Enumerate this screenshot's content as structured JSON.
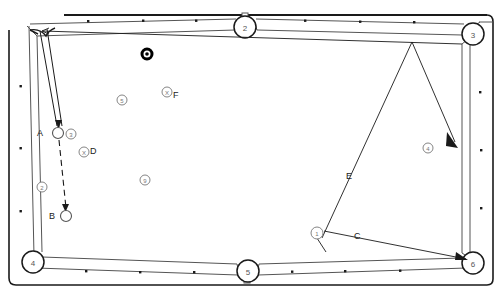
{
  "diagram": {
    "type": "pool-table-shot-diagram",
    "title": "",
    "colors": {
      "line": "#1a1a1a",
      "rail": "#555555",
      "ball_outline": "#555555",
      "eight_ball": "#000000",
      "label": "#1a1a1a",
      "background": "#ffffff"
    },
    "table": {
      "outer": {
        "x": 8,
        "y": 8,
        "w": 485,
        "h": 278
      },
      "bed": {
        "x": 22,
        "y": 22,
        "w": 457,
        "h": 250
      }
    },
    "pockets": [
      {
        "id": "p2",
        "label": "2",
        "cx": 245,
        "cy": 27,
        "r": 11,
        "position": "top-middle"
      },
      {
        "id": "p3",
        "label": "3",
        "cx": 473,
        "cy": 34,
        "r": 11,
        "position": "top-right"
      },
      {
        "id": "p4",
        "label": "4",
        "cx": 33,
        "cy": 262,
        "r": 11,
        "position": "bottom-left"
      },
      {
        "id": "p5",
        "label": "5",
        "cx": 248,
        "cy": 271,
        "r": 11,
        "position": "bottom-middle"
      },
      {
        "id": "p6",
        "label": "6",
        "cx": 473,
        "cy": 263,
        "r": 11,
        "position": "bottom-right"
      }
    ],
    "diamonds": {
      "top": [
        {
          "x": 88,
          "y": 21
        },
        {
          "x": 143,
          "y": 20
        },
        {
          "x": 196,
          "y": 20
        },
        {
          "x": 305,
          "y": 20
        },
        {
          "x": 360,
          "y": 21
        },
        {
          "x": 414,
          "y": 22
        }
      ],
      "bottom": [
        {
          "x": 86,
          "y": 271
        },
        {
          "x": 140,
          "y": 272
        },
        {
          "x": 194,
          "y": 272
        },
        {
          "x": 292,
          "y": 271
        },
        {
          "x": 345,
          "y": 271
        },
        {
          "x": 400,
          "y": 270
        }
      ],
      "left": [
        {
          "x": 20,
          "y": 86
        },
        {
          "x": 20,
          "y": 148
        },
        {
          "x": 20,
          "y": 211
        }
      ],
      "right": [
        {
          "x": 480,
          "y": 92
        },
        {
          "x": 481,
          "y": 150
        },
        {
          "x": 481,
          "y": 208
        }
      ]
    },
    "balls": [
      {
        "id": "ball-a",
        "label": "A",
        "cx": 58,
        "cy": 133,
        "r": 5.5,
        "marker": "",
        "label_pos": "left",
        "style": "open"
      },
      {
        "id": "ball-b",
        "label": "B",
        "cx": 66,
        "cy": 216,
        "r": 5.5,
        "marker": "",
        "label_pos": "left",
        "style": "open"
      },
      {
        "id": "ball-eight",
        "label": "",
        "cx": 147,
        "cy": 54,
        "r": 4.5,
        "marker": "8",
        "label_pos": "",
        "style": "eight"
      },
      {
        "id": "ball-3",
        "label": "",
        "cx": 71,
        "cy": 134,
        "r": 5,
        "marker": "3",
        "label_pos": "",
        "style": "numbered"
      },
      {
        "id": "ball-5",
        "label": "",
        "cx": 122,
        "cy": 100,
        "r": 5,
        "marker": "5",
        "label_pos": "",
        "style": "numbered"
      },
      {
        "id": "ball-9",
        "label": "",
        "cx": 145,
        "cy": 180,
        "r": 5,
        "marker": "9",
        "label_pos": "",
        "style": "numbered"
      },
      {
        "id": "ball-4",
        "label": "",
        "cx": 428,
        "cy": 148,
        "r": 5,
        "marker": "4",
        "label_pos": "",
        "style": "numbered"
      },
      {
        "id": "ball-2",
        "label": "",
        "cx": 42,
        "cy": 187,
        "r": 5,
        "marker": "2",
        "label_pos": "",
        "style": "numbered"
      },
      {
        "id": "ball-x-d",
        "label": "D",
        "cx": 84,
        "cy": 152,
        "r": 5,
        "marker": "X",
        "label_pos": "right",
        "style": "ghost"
      },
      {
        "id": "ball-x-f",
        "label": "F",
        "cx": 167,
        "cy": 92,
        "r": 5,
        "marker": "X",
        "label_pos": "right",
        "style": "ghost"
      },
      {
        "id": "ball-1",
        "label": "",
        "cx": 317,
        "cy": 233,
        "r": 6,
        "marker": "1",
        "label_pos": "",
        "style": "numbered"
      }
    ],
    "path_labels": [
      {
        "id": "label-a",
        "text": "A",
        "x": 41,
        "y": 136
      },
      {
        "id": "label-b",
        "text": "B",
        "x": 53,
        "y": 219
      },
      {
        "id": "label-c",
        "text": "C",
        "x": 358,
        "y": 236
      },
      {
        "id": "label-d",
        "text": "D",
        "x": 93,
        "y": 152
      },
      {
        "id": "label-e",
        "text": "E",
        "x": 349,
        "y": 176
      },
      {
        "id": "label-f",
        "text": "F",
        "x": 176,
        "y": 97
      }
    ],
    "shot_lines": [
      {
        "id": "cue-stick",
        "desc": "cue stick aimed at ball A from top-left pocket"
      },
      {
        "id": "path-ab",
        "desc": "dashed arrow from ball A down to ball B",
        "style": "dashed"
      },
      {
        "id": "path-e",
        "desc": "solid line from ball 1 up to top rail near pocket 3",
        "style": "solid"
      },
      {
        "id": "path-e-return",
        "desc": "solid arrow from top rail down-right toward ball 4",
        "style": "solid-arrow"
      },
      {
        "id": "path-c",
        "desc": "solid arrow from ball 1 right to pocket 6",
        "style": "solid-arrow"
      },
      {
        "id": "path-1-down",
        "desc": "short V stroke under ball 1",
        "style": "solid"
      }
    ]
  }
}
